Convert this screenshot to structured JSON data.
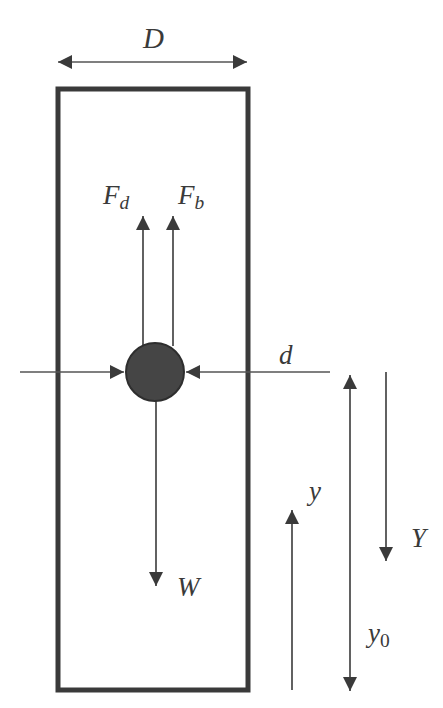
{
  "diagram": {
    "colors": {
      "stroke": "#3a3a3a",
      "particle": "#454545",
      "background": "#ffffff"
    },
    "labels": {
      "D": {
        "main": "D",
        "sub": ""
      },
      "Fd": {
        "main": "F",
        "sub": "d"
      },
      "Fb": {
        "main": "F",
        "sub": "b"
      },
      "d": {
        "main": "d",
        "sub": ""
      },
      "W": {
        "main": "W",
        "sub": ""
      },
      "y": {
        "main": "y",
        "sub": ""
      },
      "Y": {
        "main": "Y",
        "sub": ""
      },
      "y0": {
        "main": "y",
        "sub": "0"
      }
    },
    "elements": [
      {
        "id": "column",
        "kind": "rectangle",
        "meaning": "container of diameter D"
      },
      {
        "id": "particle",
        "kind": "circle",
        "meaning": "particle of diameter d"
      },
      {
        "id": "drag-force",
        "kind": "arrow-up",
        "label": "Fd"
      },
      {
        "id": "buoyancy-force",
        "kind": "arrow-up",
        "label": "Fb"
      },
      {
        "id": "weight-force",
        "kind": "arrow-down",
        "label": "W"
      },
      {
        "id": "diameter-D",
        "kind": "double-arrow-horizontal",
        "label": "D"
      },
      {
        "id": "diameter-d",
        "kind": "dimension-arrows-horizontal",
        "label": "d"
      },
      {
        "id": "height-y",
        "kind": "arrow-up",
        "label": "y"
      },
      {
        "id": "depth-Y",
        "kind": "arrow-down",
        "label": "Y"
      },
      {
        "id": "height-y0",
        "kind": "double-arrow-vertical",
        "label": "y0"
      }
    ]
  }
}
